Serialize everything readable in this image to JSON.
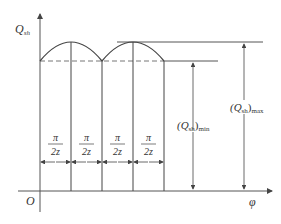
{
  "figure": {
    "y_axis_label": "Q",
    "y_axis_sub": "sh",
    "x_axis_label": "φ",
    "origin_label": "O",
    "segment_label_num": "π",
    "segment_label_den": "2z",
    "segment_count": 4,
    "min_label": "(Q",
    "min_label_sub": "sh",
    "min_label_tail": ")",
    "min_label_suffix": "min",
    "max_label": "(Q",
    "max_label_sub": "sh",
    "max_label_tail": ")",
    "max_label_suffix": "max",
    "colors": {
      "line": "#444444",
      "dash": "#666666",
      "background": "#ffffff"
    }
  }
}
